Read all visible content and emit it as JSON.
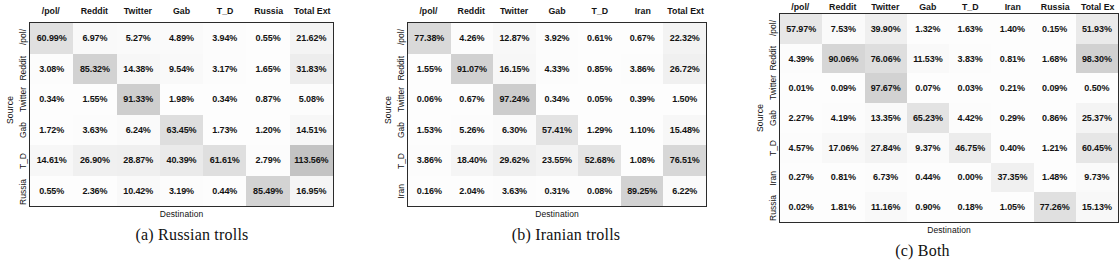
{
  "figure": {
    "axis_labels": {
      "x": "Destination",
      "y": "Source"
    },
    "panels": [
      {
        "id": "a",
        "caption": "(a) Russian trolls",
        "columns": [
          "/pol/",
          "Reddit",
          "Twitter",
          "Gab",
          "T_D",
          "Russia",
          "Total Ext"
        ],
        "rows": [
          "/pol/",
          "Reddit",
          "Twitter",
          "Gab",
          "T_D",
          "Russia"
        ],
        "values": [
          [
            "60.99%",
            "6.97%",
            "5.27%",
            "4.89%",
            "3.94%",
            "0.55%",
            "21.62%"
          ],
          [
            "3.08%",
            "85.32%",
            "14.38%",
            "9.54%",
            "3.17%",
            "1.65%",
            "31.83%"
          ],
          [
            "0.34%",
            "1.55%",
            "91.33%",
            "1.98%",
            "0.34%",
            "0.87%",
            "5.08%"
          ],
          [
            "1.72%",
            "3.63%",
            "6.24%",
            "63.45%",
            "1.73%",
            "1.20%",
            "14.51%"
          ],
          [
            "14.61%",
            "26.90%",
            "28.87%",
            "40.39%",
            "61.61%",
            "2.79%",
            "113.56%"
          ],
          [
            "0.55%",
            "2.36%",
            "10.42%",
            "3.19%",
            "0.44%",
            "85.49%",
            "16.95%"
          ]
        ],
        "shades": [
          [
            0.22,
            0.03,
            0.02,
            0.02,
            0.01,
            0.0,
            0.07
          ],
          [
            0.01,
            0.33,
            0.05,
            0.03,
            0.01,
            0.0,
            0.12
          ],
          [
            0.0,
            0.0,
            0.36,
            0.0,
            0.0,
            0.0,
            0.01
          ],
          [
            0.0,
            0.01,
            0.02,
            0.24,
            0.0,
            0.0,
            0.05
          ],
          [
            0.05,
            0.1,
            0.11,
            0.15,
            0.23,
            0.01,
            0.45
          ],
          [
            0.0,
            0.0,
            0.03,
            0.01,
            0.0,
            0.32,
            0.06
          ]
        ]
      },
      {
        "id": "b",
        "caption": "(b) Iranian trolls",
        "columns": [
          "/pol/",
          "Reddit",
          "Twitter",
          "Gab",
          "T_D",
          "Iran",
          "Total Ext"
        ],
        "rows": [
          "/pol/",
          "Reddit",
          "Twitter",
          "Gab",
          "T_D",
          "Iran"
        ],
        "values": [
          [
            "77.38%",
            "4.26%",
            "12.87%",
            "3.92%",
            "0.61%",
            "0.67%",
            "22.32%"
          ],
          [
            "1.55%",
            "91.07%",
            "16.15%",
            "4.33%",
            "0.85%",
            "3.86%",
            "26.72%"
          ],
          [
            "0.06%",
            "0.67%",
            "97.24%",
            "0.34%",
            "0.05%",
            "0.39%",
            "1.50%"
          ],
          [
            "1.53%",
            "5.26%",
            "6.30%",
            "57.41%",
            "1.29%",
            "1.10%",
            "15.48%"
          ],
          [
            "3.86%",
            "18.40%",
            "29.62%",
            "23.55%",
            "52.68%",
            "1.08%",
            "76.51%"
          ],
          [
            "0.16%",
            "2.04%",
            "3.63%",
            "0.31%",
            "0.08%",
            "89.25%",
            "6.22%"
          ]
        ],
        "shades": [
          [
            0.28,
            0.01,
            0.04,
            0.01,
            0.0,
            0.0,
            0.08
          ],
          [
            0.0,
            0.34,
            0.05,
            0.01,
            0.0,
            0.01,
            0.1
          ],
          [
            0.0,
            0.0,
            0.37,
            0.0,
            0.0,
            0.0,
            0.0
          ],
          [
            0.0,
            0.01,
            0.02,
            0.2,
            0.0,
            0.0,
            0.05
          ],
          [
            0.01,
            0.06,
            0.11,
            0.08,
            0.19,
            0.0,
            0.29
          ],
          [
            0.0,
            0.0,
            0.01,
            0.0,
            0.0,
            0.33,
            0.02
          ]
        ]
      },
      {
        "id": "c",
        "caption": "(c) Both",
        "columns": [
          "/pol/",
          "Reddit",
          "Twitter",
          "Gab",
          "T_D",
          "Iran",
          "Russia",
          "Total Ex"
        ],
        "rows": [
          "/pol/",
          "Reddit",
          "Twitter",
          "Gab",
          "T_D",
          "Iran",
          "Russia"
        ],
        "values": [
          [
            "57.97%",
            "7.53%",
            "39.90%",
            "1.32%",
            "1.63%",
            "1.40%",
            "0.15%",
            "51.93%"
          ],
          [
            "4.39%",
            "90.06%",
            "76.06%",
            "11.53%",
            "3.83%",
            "0.81%",
            "1.68%",
            "98.30%"
          ],
          [
            "0.01%",
            "0.09%",
            "97.67%",
            "0.07%",
            "0.03%",
            "0.21%",
            "0.09%",
            "0.50%"
          ],
          [
            "2.27%",
            "4.19%",
            "13.35%",
            "65.23%",
            "4.42%",
            "0.29%",
            "0.86%",
            "25.37%"
          ],
          [
            "4.57%",
            "17.06%",
            "27.84%",
            "9.37%",
            "46.75%",
            "0.40%",
            "1.21%",
            "60.45%"
          ],
          [
            "0.27%",
            "0.81%",
            "6.73%",
            "0.44%",
            "0.00%",
            "37.35%",
            "1.48%",
            "9.73%"
          ],
          [
            "0.02%",
            "1.81%",
            "11.16%",
            "0.90%",
            "0.18%",
            "1.05%",
            "77.26%",
            "15.13%"
          ]
        ],
        "shades": [
          [
            0.17,
            0.02,
            0.11,
            0.0,
            0.0,
            0.0,
            0.0,
            0.15
          ],
          [
            0.01,
            0.3,
            0.24,
            0.03,
            0.01,
            0.0,
            0.0,
            0.34
          ],
          [
            0.0,
            0.0,
            0.33,
            0.0,
            0.0,
            0.0,
            0.0,
            0.0
          ],
          [
            0.0,
            0.01,
            0.03,
            0.2,
            0.01,
            0.0,
            0.0,
            0.07
          ],
          [
            0.01,
            0.04,
            0.08,
            0.02,
            0.13,
            0.0,
            0.0,
            0.18
          ],
          [
            0.0,
            0.0,
            0.01,
            0.0,
            0.0,
            0.1,
            0.0,
            0.02
          ],
          [
            0.0,
            0.0,
            0.03,
            0.0,
            0.0,
            0.0,
            0.22,
            0.04
          ]
        ]
      }
    ]
  },
  "chart_data": {
    "type": "heatmap",
    "title": "",
    "xlabel": "Destination",
    "ylabel": "Source",
    "grid": false,
    "legend": "none",
    "note": "Three confusion-style heatmaps of percentage of URLs/content flowing from Source platform to Destination platform; last column is Total Ext (total external).",
    "panels": [
      {
        "id": "a",
        "title": "(a) Russian trolls",
        "x": [
          "/pol/",
          "Reddit",
          "Twitter",
          "Gab",
          "T_D",
          "Russia",
          "Total Ext"
        ],
        "y": [
          "/pol/",
          "Reddit",
          "Twitter",
          "Gab",
          "T_D",
          "Russia"
        ],
        "z": [
          [
            60.99,
            6.97,
            5.27,
            4.89,
            3.94,
            0.55,
            21.62
          ],
          [
            3.08,
            85.32,
            14.38,
            9.54,
            3.17,
            1.65,
            31.83
          ],
          [
            0.34,
            1.55,
            91.33,
            1.98,
            0.34,
            0.87,
            5.08
          ],
          [
            1.72,
            3.63,
            6.24,
            63.45,
            1.73,
            1.2,
            14.51
          ],
          [
            14.61,
            26.9,
            28.87,
            40.39,
            61.61,
            2.79,
            113.56
          ],
          [
            0.55,
            2.36,
            10.42,
            3.19,
            0.44,
            85.49,
            16.95
          ]
        ]
      },
      {
        "id": "b",
        "title": "(b) Iranian trolls",
        "x": [
          "/pol/",
          "Reddit",
          "Twitter",
          "Gab",
          "T_D",
          "Iran",
          "Total Ext"
        ],
        "y": [
          "/pol/",
          "Reddit",
          "Twitter",
          "Gab",
          "T_D",
          "Iran"
        ],
        "z": [
          [
            77.38,
            4.26,
            12.87,
            3.92,
            0.61,
            0.67,
            22.32
          ],
          [
            1.55,
            91.07,
            16.15,
            4.33,
            0.85,
            3.86,
            26.72
          ],
          [
            0.06,
            0.67,
            97.24,
            0.34,
            0.05,
            0.39,
            1.5
          ],
          [
            1.53,
            5.26,
            6.3,
            57.41,
            1.29,
            1.1,
            15.48
          ],
          [
            3.86,
            18.4,
            29.62,
            23.55,
            52.68,
            1.08,
            76.51
          ],
          [
            0.16,
            2.04,
            3.63,
            0.31,
            0.08,
            89.25,
            6.22
          ]
        ]
      },
      {
        "id": "c",
        "title": "(c) Both",
        "x": [
          "/pol/",
          "Reddit",
          "Twitter",
          "Gab",
          "T_D",
          "Iran",
          "Russia",
          "Total Ext"
        ],
        "y": [
          "/pol/",
          "Reddit",
          "Twitter",
          "Gab",
          "T_D",
          "Iran",
          "Russia"
        ],
        "z": [
          [
            57.97,
            7.53,
            39.9,
            1.32,
            1.63,
            1.4,
            0.15,
            51.93
          ],
          [
            4.39,
            90.06,
            76.06,
            11.53,
            3.83,
            0.81,
            1.68,
            98.3
          ],
          [
            0.01,
            0.09,
            97.67,
            0.07,
            0.03,
            0.21,
            0.09,
            0.5
          ],
          [
            2.27,
            4.19,
            13.35,
            65.23,
            4.42,
            0.29,
            0.86,
            25.37
          ],
          [
            4.57,
            17.06,
            27.84,
            9.37,
            46.75,
            0.4,
            1.21,
            60.45
          ],
          [
            0.27,
            0.81,
            6.73,
            0.44,
            0.0,
            37.35,
            1.48,
            9.73
          ],
          [
            0.02,
            1.81,
            11.16,
            0.9,
            0.18,
            1.05,
            77.26,
            15.13
          ]
        ]
      }
    ]
  }
}
